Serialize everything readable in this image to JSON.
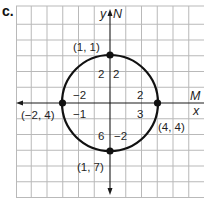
{
  "figure": {
    "part_label": "c.",
    "axes": {
      "y_label": "y",
      "y_alt_label": "N",
      "x_label": "x",
      "x_alt_label": "M"
    },
    "circle": {
      "center": [
        1,
        4
      ],
      "radius": 3
    },
    "points": {
      "top": {
        "label": "(1, 1)",
        "x": 1,
        "y": 1
      },
      "left": {
        "label": "(−2, 4)",
        "x": -2,
        "y": 4
      },
      "right": {
        "label": "(4, 4)",
        "x": 4,
        "y": 4
      },
      "bottom": {
        "label": "(1, 7)",
        "x": 1,
        "y": 7
      }
    },
    "offset_labels": {
      "top_left": "2",
      "top_right": "2",
      "left_upper": "−2",
      "right_upper": "2",
      "left_lower": "−1",
      "right_lower": "3",
      "bottom_left": "6",
      "bottom_right": "−2"
    },
    "colors": {
      "grid": "#b9b9b9",
      "curve": "#111111",
      "text": "#1f1f1f"
    }
  }
}
